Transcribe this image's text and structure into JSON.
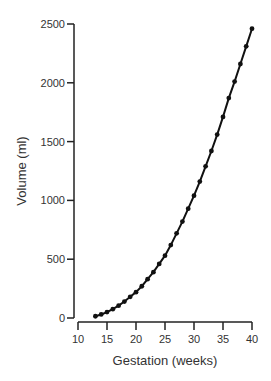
{
  "chart_data": {
    "type": "line",
    "title": "",
    "xlabel": "Gestation (weeks)",
    "ylabel": "Volume (ml)",
    "xlim": [
      10,
      40
    ],
    "ylim": [
      0,
      2500
    ],
    "x_ticks": [
      10,
      15,
      20,
      25,
      30,
      35,
      40
    ],
    "y_ticks": [
      0,
      500,
      1000,
      1500,
      2000,
      2500
    ],
    "grid": false,
    "legend": null,
    "series": [
      {
        "name": "Volume",
        "markers": true,
        "x": [
          13,
          14,
          15,
          16,
          17,
          18,
          19,
          20,
          21,
          22,
          23,
          24,
          25,
          26,
          27,
          28,
          29,
          30,
          31,
          32,
          33,
          34,
          35,
          36,
          37,
          38,
          39,
          40
        ],
        "values": [
          15,
          30,
          50,
          75,
          105,
          140,
          180,
          220,
          270,
          330,
          390,
          460,
          530,
          620,
          720,
          820,
          930,
          1040,
          1160,
          1290,
          1420,
          1560,
          1710,
          1870,
          2010,
          2160,
          2310,
          2460
        ]
      }
    ]
  },
  "colors": {
    "line": "#111111",
    "axis": "#222222",
    "text": "#333333",
    "background": "#ffffff"
  }
}
